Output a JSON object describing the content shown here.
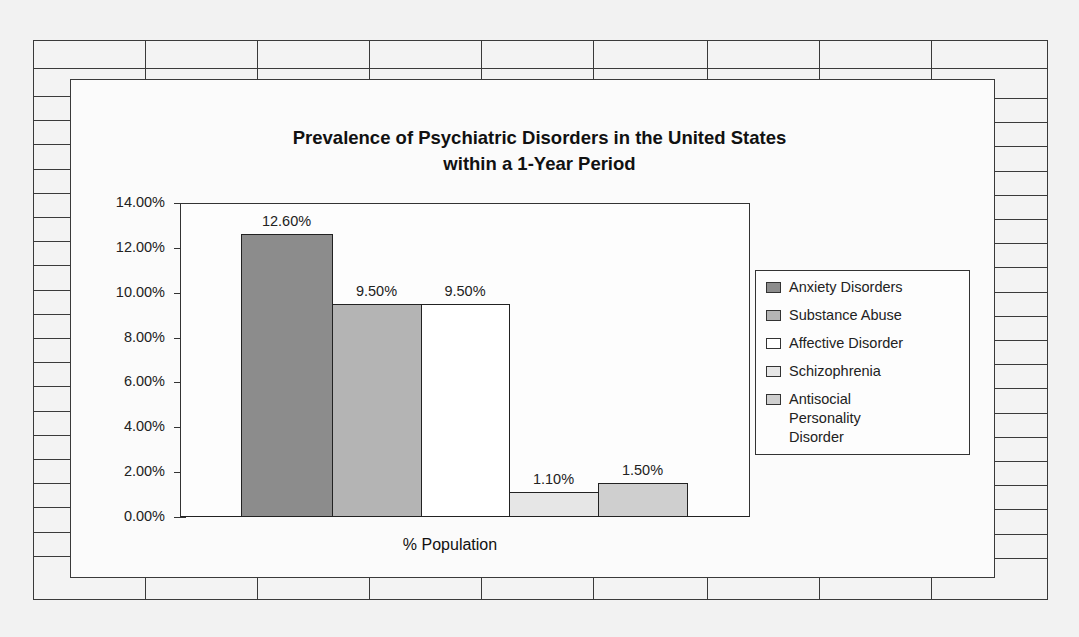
{
  "chart_data": {
    "type": "bar",
    "title": "Prevalence of Psychiatric Disorders in the United States within a 1-Year Period",
    "title_lines": [
      "Prevalence of Psychiatric Disorders in the United States",
      "within a 1-Year Period"
    ],
    "xlabel": "% Population",
    "ylabel": "",
    "categories": [
      "% Population"
    ],
    "series": [
      {
        "name": "Anxiety Disorders",
        "values": [
          12.6
        ],
        "label": "12.60%",
        "color": "#8c8c8c"
      },
      {
        "name": "Substance Abuse",
        "values": [
          9.5
        ],
        "label": "9.50%",
        "color": "#b4b4b4"
      },
      {
        "name": "Affective Disorder",
        "values": [
          9.5
        ],
        "label": "9.50%",
        "color": "#ffffff"
      },
      {
        "name": "Schizophrenia",
        "values": [
          1.1
        ],
        "label": "1.10%",
        "color": "#e6e6e6"
      },
      {
        "name": "Antisocial Personality Disorder",
        "values": [
          1.5
        ],
        "label": "1.50%",
        "color": "#cfcfcf"
      }
    ],
    "ylim": [
      0,
      14
    ],
    "yticks": [
      "0.00%",
      "2.00%",
      "4.00%",
      "6.00%",
      "8.00%",
      "10.00%",
      "12.00%",
      "14.00%"
    ],
    "grid": false,
    "legend_position": "right",
    "data_labels": true
  },
  "legend": {
    "items": [
      {
        "lines": [
          "Anxiety Disorders"
        ]
      },
      {
        "lines": [
          "Substance Abuse"
        ]
      },
      {
        "lines": [
          "Affective Disorder"
        ]
      },
      {
        "lines": [
          "Schizophrenia"
        ]
      },
      {
        "lines": [
          "Antisocial",
          "Personality",
          "Disorder"
        ]
      }
    ]
  }
}
